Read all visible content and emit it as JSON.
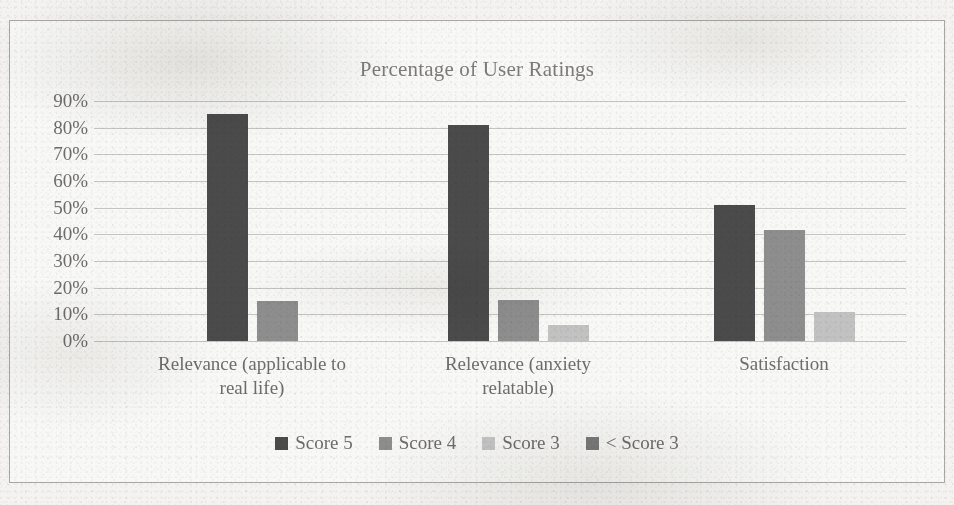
{
  "chart_data": {
    "type": "bar",
    "title": "Percentage of User Ratings",
    "xlabel": "",
    "ylabel": "",
    "ylim": [
      0,
      90
    ],
    "ytick_labels": [
      "90%",
      "80%",
      "70%",
      "60%",
      "50%",
      "40%",
      "30%",
      "20%",
      "10%",
      "0%"
    ],
    "ytick_values": [
      90,
      80,
      70,
      60,
      50,
      40,
      30,
      20,
      10,
      0
    ],
    "grid": true,
    "legend_position": "bottom",
    "categories": [
      "Relevance (applicable to real life)",
      "Relevance (anxiety relatable)",
      "Satisfaction"
    ],
    "category_lines": [
      [
        "Relevance (applicable to",
        "real life)"
      ],
      [
        "Relevance (anxiety",
        "relatable)"
      ],
      [
        "Satisfaction"
      ]
    ],
    "series": [
      {
        "name": "Score 5",
        "color": "#4b4b4b",
        "values": [
          85,
          81,
          51
        ]
      },
      {
        "name": "Score 4",
        "color": "#8e8e8e",
        "values": [
          15,
          15.5,
          41.5
        ]
      },
      {
        "name": "Score 3",
        "color": "#c2c2c2",
        "values": [
          0,
          6,
          11
        ]
      },
      {
        "name": "< Score 3",
        "color": "#7a7a7a",
        "values": [
          0,
          0,
          0
        ]
      }
    ]
  },
  "legend": {
    "items": [
      {
        "label": "Score 5"
      },
      {
        "label": "Score 4"
      },
      {
        "label": "Score 3"
      },
      {
        "label": "< Score 3"
      }
    ]
  },
  "colors": {
    "score5": "#4b4b4b",
    "score4": "#8e8e8e",
    "score3": "#c2c2c2",
    "below_score3": "#7a7a7a",
    "gridline": "#c6c4c1",
    "text": "#6f6d6b",
    "frame": "#a9a7a4",
    "background": "#f4f3f1"
  }
}
